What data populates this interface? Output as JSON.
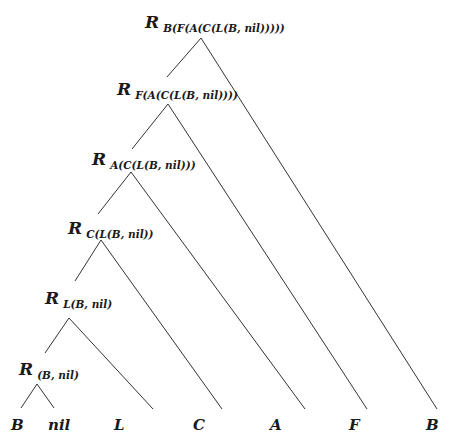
{
  "diagram": {
    "type": "tree",
    "line_color": "#333333",
    "nodes": [
      {
        "id": "n1",
        "symbol": "R",
        "subscript": "B(F(A(C(L(B, nil)))))"
      },
      {
        "id": "n2",
        "symbol": "R",
        "subscript": "F(A(C(L(B, nil))))"
      },
      {
        "id": "n3",
        "symbol": "R",
        "subscript": "A(C(L(B, nil)))"
      },
      {
        "id": "n4",
        "symbol": "R",
        "subscript": "C(L(B, nil))"
      },
      {
        "id": "n5",
        "symbol": "R",
        "subscript": "L(B, nil)"
      },
      {
        "id": "n6",
        "symbol": "R",
        "subscript": "(B, nil)"
      }
    ],
    "leaves": [
      "B",
      "nil",
      "L",
      "C",
      "A",
      "F",
      "B"
    ],
    "edges": [
      [
        "n1",
        "n2"
      ],
      [
        "n1",
        "leaf6"
      ],
      [
        "n2",
        "n3"
      ],
      [
        "n2",
        "leaf5"
      ],
      [
        "n3",
        "n4"
      ],
      [
        "n3",
        "leaf4"
      ],
      [
        "n4",
        "n5"
      ],
      [
        "n4",
        "leaf3"
      ],
      [
        "n5",
        "n6"
      ],
      [
        "n5",
        "leaf2"
      ],
      [
        "n6",
        "leaf0"
      ],
      [
        "n6",
        "leaf1"
      ]
    ]
  }
}
